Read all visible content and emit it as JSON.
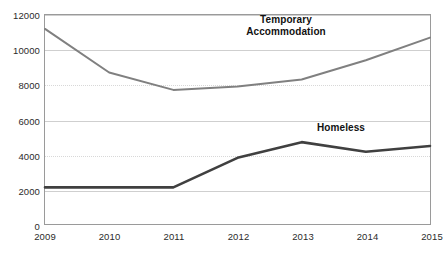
{
  "chart_data": {
    "type": "line",
    "title": "",
    "xlabel": "",
    "ylabel": "",
    "categories": [
      "2009",
      "2010",
      "2011",
      "2012",
      "2013",
      "2014",
      "2015"
    ],
    "x": [
      2009,
      2010,
      2011,
      2012,
      2013,
      2014,
      2015
    ],
    "ylim": [
      0,
      12000
    ],
    "xlim": [
      2009,
      2015
    ],
    "yticks": [
      "0",
      "2000",
      "4000",
      "6000",
      "8000",
      "10000",
      "12000"
    ],
    "ytick_values": [
      0,
      2000,
      4000,
      6000,
      8000,
      10000,
      12000
    ],
    "grid": true,
    "grid_orientation": "horizontal",
    "legend": "inline-labels",
    "series": [
      {
        "name": "Temporary Accommodation",
        "label": "Temporary\nAccommodation",
        "color": "#808080",
        "line_width": 2,
        "values": [
          11200,
          8700,
          7700,
          7900,
          8300,
          9400,
          10700
        ]
      },
      {
        "name": "Homeless",
        "label": "Homeless",
        "color": "#404040",
        "line_width": 2.6,
        "values": [
          2100,
          2100,
          2100,
          3800,
          4700,
          4150,
          4480
        ]
      }
    ]
  },
  "axes": {
    "frame_color": "#9a9a9a",
    "gridline_color": "#cfcfcf"
  },
  "caption": {
    "text": ""
  }
}
